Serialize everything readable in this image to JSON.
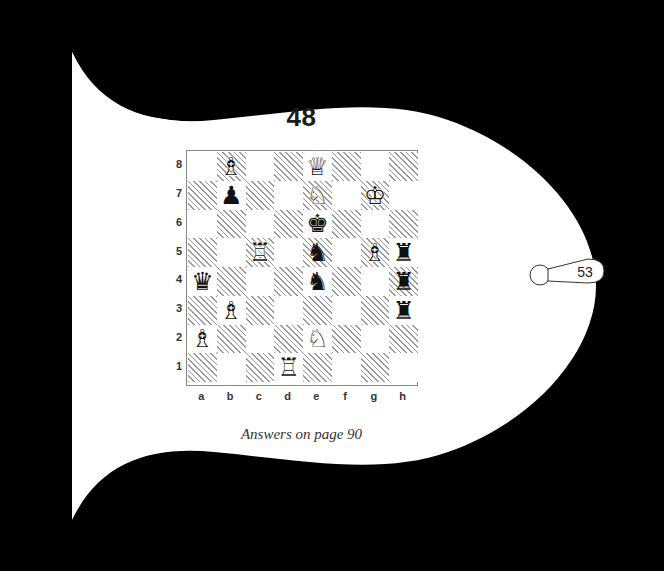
{
  "page": {
    "puzzle_number": "48",
    "answers_note": "Answers on page 90",
    "page_tab_number": "53",
    "background_color": "#000000",
    "paper_color": "#ffffff",
    "ink_color": "#1a1a1a"
  },
  "board": {
    "files": [
      "a",
      "b",
      "c",
      "d",
      "e",
      "f",
      "g",
      "h"
    ],
    "ranks": [
      "8",
      "7",
      "6",
      "5",
      "4",
      "3",
      "2",
      "1"
    ],
    "light_square_color": "#ffffff",
    "dark_square_hatch_color": "#9a9a9a",
    "border_color": "#8a8a8a",
    "pieces": [
      {
        "square": "b8",
        "color": "white",
        "type": "bishop",
        "glyph": "♗"
      },
      {
        "square": "e8",
        "color": "white",
        "type": "queen",
        "glyph": "♕"
      },
      {
        "square": "b7",
        "color": "black",
        "type": "pawn",
        "glyph": "♟"
      },
      {
        "square": "e7",
        "color": "white",
        "type": "knight",
        "glyph": "♘"
      },
      {
        "square": "g7",
        "color": "white",
        "type": "king",
        "glyph": "♔"
      },
      {
        "square": "e6",
        "color": "black",
        "type": "king",
        "glyph": "♚"
      },
      {
        "square": "c5",
        "color": "white",
        "type": "rook",
        "glyph": "♖"
      },
      {
        "square": "e5",
        "color": "black",
        "type": "knight",
        "glyph": "♞"
      },
      {
        "square": "g5",
        "color": "white",
        "type": "bishop",
        "glyph": "♗"
      },
      {
        "square": "h5",
        "color": "black",
        "type": "rook",
        "glyph": "♜"
      },
      {
        "square": "a4",
        "color": "black",
        "type": "queen",
        "glyph": "♛"
      },
      {
        "square": "e4",
        "color": "black",
        "type": "knight",
        "glyph": "♞"
      },
      {
        "square": "h4",
        "color": "black",
        "type": "rook",
        "glyph": "♜"
      },
      {
        "square": "b3",
        "color": "white",
        "type": "bishop",
        "glyph": "♗"
      },
      {
        "square": "h3",
        "color": "black",
        "type": "rook",
        "glyph": "♜"
      },
      {
        "square": "a2",
        "color": "white",
        "type": "bishop",
        "glyph": "♗"
      },
      {
        "square": "e2",
        "color": "white",
        "type": "knight",
        "glyph": "♘"
      },
      {
        "square": "d1",
        "color": "white",
        "type": "rook",
        "glyph": "♖"
      }
    ]
  }
}
